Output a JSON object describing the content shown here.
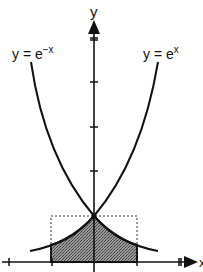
{
  "diagram": {
    "axes": {
      "x_label": "x",
      "y_label": "y",
      "x_ticks": [
        -2,
        -1,
        1,
        2
      ],
      "y_ticks": [
        1,
        2,
        3,
        4,
        5
      ]
    },
    "curves": [
      {
        "name": "exp-neg",
        "label_base": "y = e",
        "label_exp": "−x"
      },
      {
        "name": "exp-pos",
        "label_base": "y = e",
        "label_exp": "x"
      }
    ],
    "shaded_region": {
      "x_from": -1,
      "x_to": 1,
      "bounded_by": "min(e^x, e^-x) and x-axis"
    },
    "dashed_rectangle": {
      "x_from": -1,
      "x_to": 1,
      "y_from": 0,
      "y_to": 1
    },
    "colors": {
      "ink": "#111111",
      "shade": "#7a7a7a",
      "background": "#ffffff"
    }
  }
}
